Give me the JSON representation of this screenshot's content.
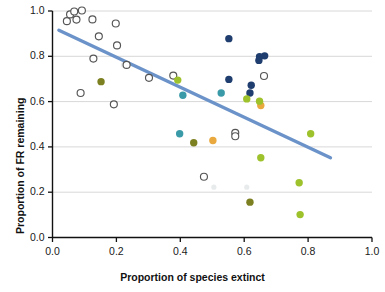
{
  "chart_data": {
    "type": "scatter",
    "title": "",
    "xlabel": "Proportion of species extinct",
    "ylabel": "Proportion of FR remaining",
    "xlim": [
      0.0,
      1.0
    ],
    "ylim": [
      0.0,
      1.0
    ],
    "xticks": [
      "0.0",
      "0.2",
      "0.4",
      "0.6",
      "0.8",
      "1.0"
    ],
    "xtick_values": [
      0.0,
      0.2,
      0.4,
      0.6,
      0.8,
      1.0
    ],
    "yticks": [
      "0.0",
      "0.2",
      "0.4",
      "0.6",
      "0.8",
      "1.0"
    ],
    "ytick_values": [
      0.0,
      0.2,
      0.4,
      0.6,
      0.8,
      1.0
    ],
    "grid": "horizontal",
    "grid_color": "#d8d8d8",
    "legend": "none",
    "axis_color": "#111111",
    "background": "#ffffff",
    "trendline": {
      "name": "linear fit",
      "color": "#6b93c9",
      "width": 3.4,
      "x0": 0.02,
      "y0": 0.915,
      "x1": 0.87,
      "y1": 0.352
    },
    "series": [
      {
        "name": "open-circles",
        "marker": "open-circle",
        "color": "#ffffff",
        "edge_color": "#555555",
        "points": [
          {
            "x": 0.045,
            "y": 0.955
          },
          {
            "x": 0.055,
            "y": 0.985
          },
          {
            "x": 0.068,
            "y": 0.998
          },
          {
            "x": 0.075,
            "y": 0.962
          },
          {
            "x": 0.092,
            "y": 1.002
          },
          {
            "x": 0.125,
            "y": 0.963
          },
          {
            "x": 0.128,
            "y": 0.79
          },
          {
            "x": 0.145,
            "y": 0.888
          },
          {
            "x": 0.198,
            "y": 0.945
          },
          {
            "x": 0.202,
            "y": 0.848
          },
          {
            "x": 0.192,
            "y": 0.588
          },
          {
            "x": 0.088,
            "y": 0.638
          },
          {
            "x": 0.232,
            "y": 0.762
          },
          {
            "x": 0.302,
            "y": 0.705
          },
          {
            "x": 0.378,
            "y": 0.715
          },
          {
            "x": 0.572,
            "y": 0.462
          },
          {
            "x": 0.572,
            "y": 0.447
          },
          {
            "x": 0.662,
            "y": 0.713
          },
          {
            "x": 0.474,
            "y": 0.268
          }
        ]
      },
      {
        "name": "navy-filled",
        "marker": "filled-circle",
        "color": "#1f3d6e",
        "points": [
          {
            "x": 0.552,
            "y": 0.878
          },
          {
            "x": 0.648,
            "y": 0.798
          },
          {
            "x": 0.664,
            "y": 0.802
          },
          {
            "x": 0.646,
            "y": 0.782
          },
          {
            "x": 0.552,
            "y": 0.698
          },
          {
            "x": 0.622,
            "y": 0.672
          },
          {
            "x": 0.618,
            "y": 0.638
          }
        ]
      },
      {
        "name": "teal-filled",
        "marker": "filled-circle",
        "color": "#3b9aa8",
        "points": [
          {
            "x": 0.408,
            "y": 0.628
          },
          {
            "x": 0.528,
            "y": 0.638
          },
          {
            "x": 0.398,
            "y": 0.458
          }
        ]
      },
      {
        "name": "olive-filled",
        "marker": "filled-circle",
        "color": "#7d8021",
        "points": [
          {
            "x": 0.152,
            "y": 0.688
          },
          {
            "x": 0.442,
            "y": 0.418
          },
          {
            "x": 0.618,
            "y": 0.156
          }
        ]
      },
      {
        "name": "orange-filled",
        "marker": "filled-circle",
        "color": "#e9a93e",
        "points": [
          {
            "x": 0.502,
            "y": 0.428
          },
          {
            "x": 0.652,
            "y": 0.583
          }
        ]
      },
      {
        "name": "yellowgreen-filled",
        "marker": "filled-circle",
        "color": "#9ec22b",
        "points": [
          {
            "x": 0.392,
            "y": 0.695
          },
          {
            "x": 0.608,
            "y": 0.612
          },
          {
            "x": 0.648,
            "y": 0.602
          },
          {
            "x": 0.808,
            "y": 0.458
          },
          {
            "x": 0.652,
            "y": 0.352
          },
          {
            "x": 0.772,
            "y": 0.242
          },
          {
            "x": 0.775,
            "y": 0.101
          }
        ]
      },
      {
        "name": "faint-background",
        "marker": "faint",
        "color": "#d9dde0",
        "points": [
          {
            "x": 0.222,
            "y": 0.762
          },
          {
            "x": 0.505,
            "y": 0.222
          },
          {
            "x": 0.608,
            "y": 0.222
          }
        ]
      }
    ]
  }
}
